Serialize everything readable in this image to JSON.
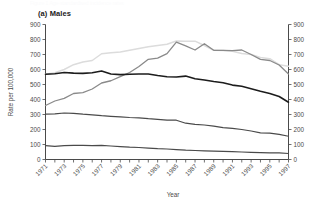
{
  "figure": {
    "ghost_caption": "Figure 1 Age-standardised incidence rates",
    "panel_label": "(a) Males"
  },
  "chart_data": {
    "type": "line",
    "title": "(a) Males",
    "xlabel": "Year",
    "ylabel": "Rate per 100,000",
    "ylabel_right": "",
    "xlim": [
      1971,
      1997
    ],
    "ylim": [
      0,
      900
    ],
    "grid": false,
    "legend": "none",
    "y_ticks": [
      0,
      100,
      200,
      300,
      400,
      500,
      600,
      700,
      800,
      900
    ],
    "y_ticks_right": [
      0,
      100,
      200,
      300,
      400,
      500,
      600,
      700,
      800,
      900
    ],
    "x": [
      1971,
      1972,
      1973,
      1974,
      1975,
      1976,
      1977,
      1978,
      1979,
      1980,
      1981,
      1982,
      1983,
      1984,
      1985,
      1986,
      1987,
      1988,
      1989,
      1990,
      1991,
      1992,
      1993,
      1994,
      1995,
      1996,
      1997
    ],
    "x_tick_labels": [
      "1971",
      "1973",
      "1975",
      "1977",
      "1979",
      "1981",
      "1983",
      "1985",
      "1987",
      "1989",
      "1991",
      "1993",
      "1995",
      "1997"
    ],
    "series": [
      {
        "name": "series-1-light-grey",
        "color": "#dcdcdc",
        "width": 1.5,
        "values": [
          568,
          578,
          600,
          632,
          650,
          660,
          705,
          712,
          716,
          728,
          740,
          752,
          760,
          768,
          790,
          788,
          789,
          760,
          728,
          726,
          722,
          706,
          700,
          680,
          672,
          632,
          622
        ]
      },
      {
        "name": "series-2-mid-grey",
        "color": "#8a8a8a",
        "width": 1.3,
        "values": [
          360,
          390,
          408,
          440,
          446,
          470,
          510,
          525,
          552,
          580,
          620,
          668,
          676,
          706,
          782,
          758,
          730,
          772,
          728,
          728,
          726,
          730,
          700,
          668,
          660,
          630,
          570
        ]
      },
      {
        "name": "series-3-dark",
        "color": "#1c1c1c",
        "width": 1.6,
        "values": [
          568,
          572,
          580,
          576,
          574,
          578,
          590,
          570,
          566,
          568,
          570,
          570,
          560,
          552,
          550,
          556,
          538,
          530,
          520,
          512,
          496,
          488,
          472,
          455,
          440,
          420,
          382
        ]
      },
      {
        "name": "series-4-medium",
        "color": "#4a4a4a",
        "width": 1.2,
        "values": [
          302,
          304,
          310,
          308,
          302,
          298,
          292,
          288,
          284,
          280,
          278,
          272,
          268,
          262,
          262,
          242,
          234,
          230,
          222,
          212,
          208,
          200,
          190,
          178,
          176,
          168,
          155
        ]
      },
      {
        "name": "series-5-lowest",
        "color": "#4a4a4a",
        "width": 1.2,
        "values": [
          92,
          88,
          92,
          94,
          94,
          93,
          94,
          90,
          86,
          82,
          80,
          76,
          72,
          70,
          66,
          62,
          60,
          58,
          56,
          54,
          52,
          50,
          48,
          46,
          44,
          44,
          40
        ]
      }
    ]
  }
}
